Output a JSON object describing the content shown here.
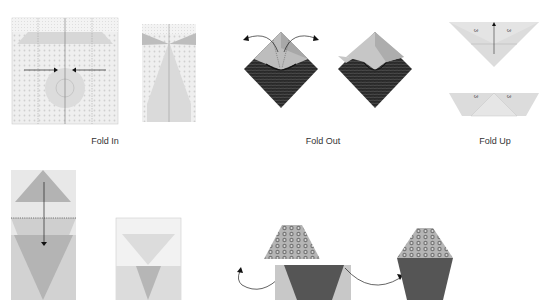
{
  "steps": [
    {
      "id": "fold-in",
      "label": "Fold In"
    },
    {
      "id": "fold-out",
      "label": "Fold Out"
    },
    {
      "id": "fold-up",
      "label": "Fold Up"
    }
  ],
  "fold_up_marks": {
    "left": "3",
    "right": "3"
  },
  "colors": {
    "paper_light": "#e6e6e6",
    "paper_mid": "#cfcfcf",
    "paper_dark": "#a9a9a9",
    "paper_darker": "#5a5a5a",
    "pattern_dark": "#2b2b2b",
    "line": "#555555"
  }
}
